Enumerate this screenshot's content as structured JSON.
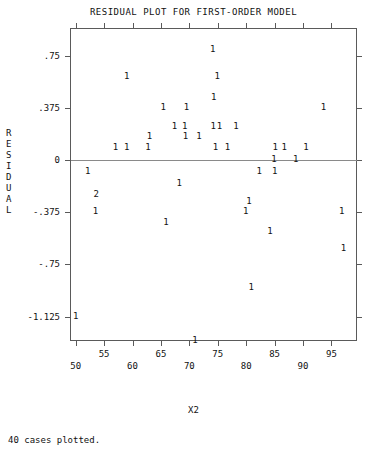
{
  "title": "RESIDUAL PLOT FOR FIRST-ORDER MODEL",
  "y_axis_title_chars": [
    "R",
    "E",
    "S",
    "I",
    "D",
    "U",
    "A",
    "L"
  ],
  "x_axis_title": "X2",
  "footer": "40 cases plotted.",
  "chart_data": {
    "type": "scatter",
    "title": "RESIDUAL PLOT FOR FIRST-ORDER MODEL",
    "xlabel": "X2",
    "ylabel": "RESIDUAL",
    "xlim": [
      49.0,
      99.5
    ],
    "ylim": [
      -1.3,
      0.95
    ],
    "grid": false,
    "legend": null,
    "marker_glyph": "1",
    "overlap_glyph": "2",
    "n_cases": 40,
    "xticks": [
      50,
      55,
      60,
      65,
      70,
      75,
      80,
      85,
      90,
      95
    ],
    "xtick_labels": [
      "50",
      "55",
      "60",
      "65",
      "70",
      "75",
      "80",
      "85",
      "90",
      "95"
    ],
    "yticks": [
      0.75,
      0.375,
      0,
      -0.375,
      -0.75,
      -1.125
    ],
    "ytick_labels": [
      ".75",
      ".375",
      "0",
      "-.375",
      "-.75",
      "-1.125"
    ],
    "reference_line_y": 0,
    "points": [
      {
        "x": 74.1,
        "y": 0.79,
        "count": 1
      },
      {
        "x": 59.0,
        "y": 0.6,
        "count": 1
      },
      {
        "x": 74.9,
        "y": 0.6,
        "count": 1
      },
      {
        "x": 74.3,
        "y": 0.45,
        "count": 1
      },
      {
        "x": 65.4,
        "y": 0.375,
        "count": 1
      },
      {
        "x": 69.5,
        "y": 0.375,
        "count": 1
      },
      {
        "x": 93.6,
        "y": 0.375,
        "count": 1
      },
      {
        "x": 67.4,
        "y": 0.24,
        "count": 1
      },
      {
        "x": 69.2,
        "y": 0.24,
        "count": 1
      },
      {
        "x": 74.2,
        "y": 0.24,
        "count": 1
      },
      {
        "x": 75.3,
        "y": 0.24,
        "count": 1
      },
      {
        "x": 78.2,
        "y": 0.24,
        "count": 1
      },
      {
        "x": 63.0,
        "y": 0.165,
        "count": 1
      },
      {
        "x": 69.3,
        "y": 0.165,
        "count": 1
      },
      {
        "x": 71.7,
        "y": 0.165,
        "count": 1
      },
      {
        "x": 57.0,
        "y": 0.085,
        "count": 1
      },
      {
        "x": 59.0,
        "y": 0.085,
        "count": 1
      },
      {
        "x": 62.7,
        "y": 0.085,
        "count": 1
      },
      {
        "x": 74.6,
        "y": 0.085,
        "count": 1
      },
      {
        "x": 76.7,
        "y": 0.085,
        "count": 1
      },
      {
        "x": 85.1,
        "y": 0.085,
        "count": 1
      },
      {
        "x": 86.7,
        "y": 0.085,
        "count": 1
      },
      {
        "x": 90.5,
        "y": 0.085,
        "count": 1
      },
      {
        "x": 84.9,
        "y": 0.0,
        "count": 1
      },
      {
        "x": 88.7,
        "y": 0.0,
        "count": 1
      },
      {
        "x": 52.1,
        "y": -0.085,
        "count": 1
      },
      {
        "x": 82.3,
        "y": -0.085,
        "count": 1
      },
      {
        "x": 85.0,
        "y": -0.085,
        "count": 1
      },
      {
        "x": 68.2,
        "y": -0.17,
        "count": 1
      },
      {
        "x": 53.6,
        "y": -0.25,
        "count": 2
      },
      {
        "x": 80.5,
        "y": -0.3,
        "count": 1
      },
      {
        "x": 53.5,
        "y": -0.375,
        "count": 1
      },
      {
        "x": 79.9,
        "y": -0.375,
        "count": 1
      },
      {
        "x": 96.8,
        "y": -0.375,
        "count": 1
      },
      {
        "x": 65.9,
        "y": -0.45,
        "count": 1
      },
      {
        "x": 84.2,
        "y": -0.52,
        "count": 1
      },
      {
        "x": 97.1,
        "y": -0.64,
        "count": 1
      },
      {
        "x": 80.9,
        "y": -0.92,
        "count": 1
      },
      {
        "x": 50.0,
        "y": -1.125,
        "count": 1
      },
      {
        "x": 71.0,
        "y": -1.3,
        "count": 1
      }
    ]
  }
}
